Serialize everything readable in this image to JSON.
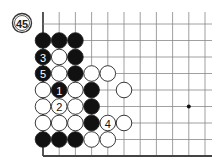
{
  "problem": {
    "number": "45"
  },
  "board": {
    "origin_x": 43,
    "origin_y": 24,
    "spacing_x": 16.2,
    "spacing_y": 16.5,
    "cols": 11,
    "rows": 9,
    "left_edge": true,
    "bottom_edge": true,
    "line_color": "#888888",
    "edge_color": "#444444",
    "star_points": [
      {
        "col": 9,
        "row": 5
      }
    ]
  },
  "stones": [
    {
      "col": 0,
      "row": 1,
      "color": "black",
      "label": ""
    },
    {
      "col": 1,
      "row": 1,
      "color": "black",
      "label": ""
    },
    {
      "col": 2,
      "row": 1,
      "color": "black",
      "label": ""
    },
    {
      "col": 0,
      "row": 2,
      "color": "black",
      "label": "3"
    },
    {
      "col": 1,
      "row": 2,
      "color": "white",
      "label": ""
    },
    {
      "col": 2,
      "row": 2,
      "color": "black",
      "label": ""
    },
    {
      "col": 0,
      "row": 3,
      "color": "black",
      "label": "5"
    },
    {
      "col": 1,
      "row": 3,
      "color": "white",
      "label": ""
    },
    {
      "col": 2,
      "row": 3,
      "color": "black",
      "label": ""
    },
    {
      "col": 3,
      "row": 3,
      "color": "white",
      "label": ""
    },
    {
      "col": 4,
      "row": 3,
      "color": "white",
      "label": ""
    },
    {
      "col": 0,
      "row": 4,
      "color": "white",
      "label": ""
    },
    {
      "col": 1,
      "row": 4,
      "color": "black",
      "label": "1"
    },
    {
      "col": 2,
      "row": 4,
      "color": "white",
      "label": ""
    },
    {
      "col": 3,
      "row": 4,
      "color": "black",
      "label": ""
    },
    {
      "col": 5,
      "row": 4,
      "color": "white",
      "label": ""
    },
    {
      "col": 0,
      "row": 5,
      "color": "white",
      "label": ""
    },
    {
      "col": 1,
      "row": 5,
      "color": "white",
      "label": "2"
    },
    {
      "col": 2,
      "row": 5,
      "color": "white",
      "label": ""
    },
    {
      "col": 3,
      "row": 5,
      "color": "black",
      "label": ""
    },
    {
      "col": 0,
      "row": 6,
      "color": "white",
      "label": ""
    },
    {
      "col": 1,
      "row": 6,
      "color": "white",
      "label": ""
    },
    {
      "col": 2,
      "row": 6,
      "color": "white",
      "label": ""
    },
    {
      "col": 3,
      "row": 6,
      "color": "black",
      "label": ""
    },
    {
      "col": 4,
      "row": 6,
      "color": "white",
      "label": "4"
    },
    {
      "col": 5,
      "row": 6,
      "color": "white",
      "label": ""
    },
    {
      "col": 0,
      "row": 7,
      "color": "black",
      "label": ""
    },
    {
      "col": 1,
      "row": 7,
      "color": "black",
      "label": ""
    },
    {
      "col": 2,
      "row": 7,
      "color": "black",
      "label": ""
    },
    {
      "col": 3,
      "row": 7,
      "color": "white",
      "label": ""
    },
    {
      "col": 4,
      "row": 7,
      "color": "white",
      "label": ""
    }
  ]
}
